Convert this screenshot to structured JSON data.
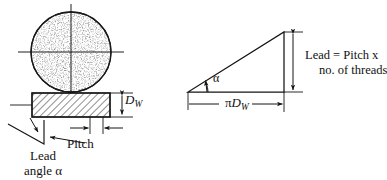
{
  "figure": {
    "type": "engineering-diagram",
    "left_view": {
      "circle": {
        "label": "worm cross-section",
        "fill": "stippled",
        "cx": 71,
        "cy": 52,
        "r": 40
      },
      "bar": {
        "label": "thread flank bar",
        "fill": "hatched",
        "x": 32,
        "y": 93,
        "w": 78,
        "h": 24
      },
      "labels": {
        "diameter": "D",
        "diameter_sub": "W",
        "pitch": "Pitch",
        "lead_angle_line1": "Lead",
        "lead_angle_line2": "angle",
        "lead_angle_symbol": "α"
      }
    },
    "right_view": {
      "triangle": {
        "label": "unrolled helix triangle",
        "x1": 188,
        "y1": 92,
        "x2": 284,
        "y2": 92,
        "x3": 284,
        "y3": 32
      },
      "labels": {
        "angle": "α",
        "base_pi": "π",
        "base_d": "D",
        "base_sub": "W",
        "lead_line1": "Lead = Pitch x",
        "lead_line2": "no. of threads"
      }
    },
    "colors": {
      "ink": "#1a1a1a",
      "paper": "#ffffff",
      "hatch": "#2a2a2a",
      "stipple": "#333333"
    }
  }
}
